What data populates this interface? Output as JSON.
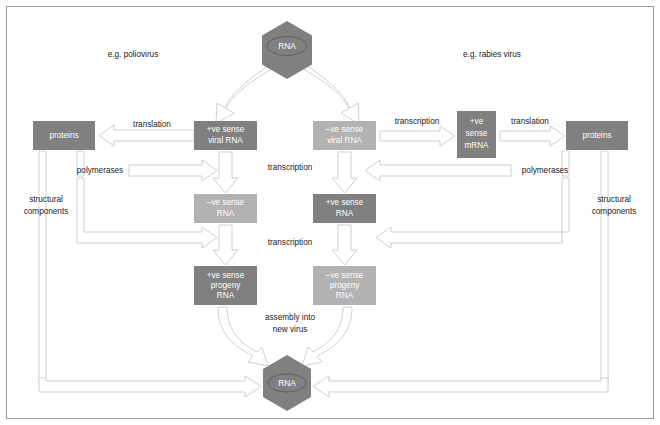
{
  "figure": {
    "title_left": "e.g. poliovirus",
    "title_right": "e.g. rabies virus",
    "colors": {
      "dark_gray": "#808080",
      "light_gray": "#b2b2b2",
      "outline": "#c9c9c9",
      "frame": "#9a9a9a",
      "text_on_box": "#ffffff",
      "text_plain": "#1a1a1a"
    }
  },
  "nodes": {
    "rna_top": {
      "label": "RNA",
      "shape": "hexagon",
      "fill": "dark_gray"
    },
    "rna_bottom": {
      "label": "RNA",
      "shape": "hexagon",
      "fill": "dark_gray"
    },
    "proteins_left": {
      "label": "proteins",
      "fill": "dark_gray"
    },
    "proteins_right": {
      "label": "proteins",
      "fill": "dark_gray"
    },
    "pos_viral_rna": {
      "line1": "+ve sense",
      "line2": "viral RNA",
      "fill": "dark_gray"
    },
    "neg_viral_rna": {
      "line1": "–ve sense",
      "line2": "viral RNA",
      "fill": "light_gray"
    },
    "neg_sense_rna": {
      "line1": "–ve sense",
      "line2": "RNA",
      "fill": "light_gray"
    },
    "pos_sense_rna": {
      "line1": "+ve sense",
      "line2": "RNA",
      "fill": "dark_gray"
    },
    "pos_progeny": {
      "line1": "+ve sense",
      "line2": "progeny",
      "line3": "RNA",
      "fill": "dark_gray"
    },
    "neg_progeny": {
      "line1": "–ve sense",
      "line2": "progeny",
      "line3": "RNA",
      "fill": "light_gray"
    },
    "pos_mrna": {
      "line1": "+ve",
      "line2": "sense",
      "line3": "mRNA",
      "fill": "dark_gray"
    }
  },
  "edge_labels": {
    "translation_left": "translation",
    "translation_right": "translation",
    "transcription_right_of_neg_viral": "transcription",
    "transcription_mid_upper": "transcription",
    "transcription_mid_lower": "transcription",
    "polymerases_left": "polymerases",
    "polymerases_right": "polymerases",
    "structural_left_line1": "structural",
    "structural_left_line2": "components",
    "structural_right_line1": "structural",
    "structural_right_line2": "components",
    "assembly_line1": "assembly into",
    "assembly_line2": "new virus"
  }
}
